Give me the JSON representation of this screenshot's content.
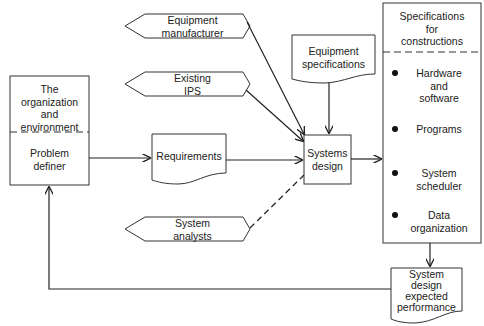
{
  "diagram": {
    "type": "flowchart",
    "nodes": {
      "organization": {
        "title": "The organization and environment",
        "title_lines": [
          "The",
          "organization",
          "and",
          "environment"
        ],
        "sub": "Problem definer",
        "sub_lines": [
          "Problem",
          "definer"
        ]
      },
      "equipment_manufacturer": {
        "label": "Equipment manufacturer",
        "lines": [
          "Equipment",
          "manufacturer"
        ],
        "shape": "hexagon"
      },
      "existing_ips": {
        "label": "Existing IPS",
        "lines": [
          "Existing",
          "IPS"
        ],
        "shape": "hexagon"
      },
      "system_analysts": {
        "label": "System analysts",
        "lines": [
          "System",
          "analysts"
        ],
        "shape": "hexagon"
      },
      "requirements": {
        "label": "Requirements",
        "shape": "document"
      },
      "equipment_specifications": {
        "label": "Equipment specifications",
        "lines": [
          "Equipment",
          "specifications"
        ],
        "shape": "document"
      },
      "systems_design": {
        "label": "Systems design",
        "lines": [
          "Systems",
          "design"
        ],
        "shape": "process"
      },
      "specifications": {
        "title": "Specifications for constructions",
        "title_lines": [
          "Specifications",
          "for",
          "constructions"
        ],
        "items": [
          {
            "lines": [
              "Hardware",
              "and",
              "software"
            ]
          },
          {
            "lines": [
              "Programs"
            ]
          },
          {
            "lines": [
              "System",
              "scheduler"
            ]
          },
          {
            "lines": [
              "Data",
              "organization"
            ]
          }
        ]
      },
      "expected_performance": {
        "label": "System design expected performance",
        "lines": [
          "System",
          "design",
          "expected",
          "performance"
        ],
        "shape": "document"
      }
    },
    "edges": [
      {
        "from": "Problem definer",
        "to": "Requirements",
        "style": "solid"
      },
      {
        "from": "Requirements",
        "to": "Systems design",
        "style": "solid"
      },
      {
        "from": "Equipment manufacturer",
        "to": "Systems design",
        "style": "solid"
      },
      {
        "from": "Existing IPS",
        "to": "Systems design",
        "style": "solid"
      },
      {
        "from": "Equipment specifications",
        "to": "Systems design",
        "style": "solid"
      },
      {
        "from": "System analysts",
        "to": "Systems design",
        "style": "dashed"
      },
      {
        "from": "Systems design",
        "to": "Specifications for constructions",
        "style": "solid"
      },
      {
        "from": "Specifications for constructions",
        "to": "System design expected performance",
        "style": "solid"
      },
      {
        "from": "System design expected performance",
        "to": "Problem definer",
        "style": "solid"
      }
    ]
  }
}
